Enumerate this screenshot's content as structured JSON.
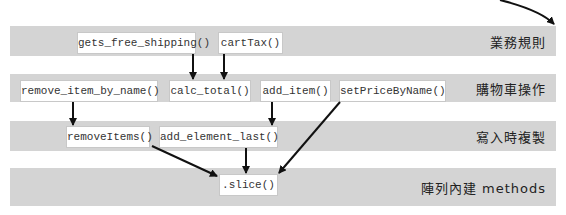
{
  "layers": [
    {
      "label": "業務規則",
      "functions": [
        "gets_free_shipping()",
        "cartTax()"
      ]
    },
    {
      "label": "購物車操作",
      "functions": [
        "remove_item_by_name()",
        "calc_total()",
        "add_item()",
        "setPriceByName()"
      ]
    },
    {
      "label": "寫入時複製",
      "functions": [
        "removeItems()",
        "add_element_last()"
      ]
    },
    {
      "label": "陣列內建 methods",
      "functions": [
        ".slice()"
      ]
    }
  ],
  "edges": [
    {
      "from": "gets_free_shipping()",
      "to": "calc_total()"
    },
    {
      "from": "cartTax()",
      "to": "calc_total()"
    },
    {
      "from": "remove_item_by_name()",
      "to": "removeItems()"
    },
    {
      "from": "add_item()",
      "to": "add_element_last()"
    },
    {
      "from": "setPriceByName()",
      "to": ".slice()"
    },
    {
      "from": "removeItems()",
      "to": ".slice()"
    },
    {
      "from": "add_element_last()",
      "to": ".slice()"
    }
  ]
}
